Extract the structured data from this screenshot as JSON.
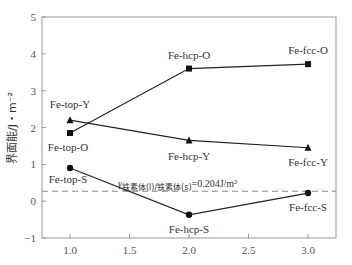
{
  "chart_data": {
    "type": "line",
    "title": "",
    "xlabel": "",
    "ylabel": "界面能/J・m⁻²",
    "xlim": [
      0.8,
      3.25
    ],
    "ylim": [
      -1,
      5
    ],
    "xticks": [
      "1.0",
      "1.5",
      "2.0",
      "2.5",
      "3.0"
    ],
    "yticks": [
      "-1",
      "0",
      "1",
      "2",
      "3",
      "4",
      "5"
    ],
    "grid": false,
    "legend": null,
    "x": [
      1.0,
      2.0,
      3.0
    ],
    "series": [
      {
        "name": "O",
        "marker": "square",
        "values": [
          1.85,
          3.6,
          3.72
        ],
        "labels": [
          "Fe-top-O",
          "Fe-hcp-O",
          "Fe-fcc-O"
        ]
      },
      {
        "name": "Y",
        "marker": "triangle",
        "values": [
          2.2,
          1.65,
          1.45
        ],
        "labels": [
          "Fe-top-Y",
          "Fe-hcp-Y",
          "Fe-fcc-Y"
        ]
      },
      {
        "name": "S",
        "marker": "circle",
        "values": [
          0.9,
          -0.37,
          0.22
        ],
        "labels": [
          "Fe-top-S",
          "Fe-hcp-S",
          "Fe-fcc-S"
        ]
      }
    ],
    "reference_line": {
      "style": "dashed",
      "y": 0.27,
      "label_prefix": "γ",
      "label_subscript": "铁素体(l)/铁素体(s)",
      "label_value": "=0.204J/m²"
    }
  }
}
